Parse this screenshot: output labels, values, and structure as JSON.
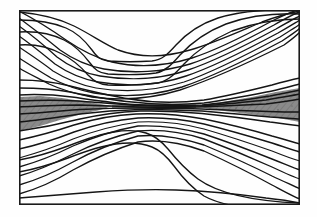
{
  "figure": {
    "title": "",
    "subtitle": "",
    "background_color": "#fefefe",
    "frame": {
      "x": 19,
      "y": 10,
      "width": 281,
      "height": 195,
      "stroke_color": "#1a1a1a",
      "stroke_width": 1.6
    }
  },
  "style": {
    "contour_color": "#151515",
    "shade_color": "#8a8a8a",
    "shade_color_dark": "#7c7c7c",
    "paper_color": "#fefefe"
  },
  "chart_data": {
    "type": "line",
    "plot_kind": "contour",
    "title": "",
    "xlabel": "",
    "ylabel": "",
    "xlim": [
      0,
      1
    ],
    "ylim": [
      0,
      1
    ],
    "grid": false,
    "legend": null,
    "axis_ticks_visible": false,
    "tick_labels_x": [],
    "tick_labels_y": [],
    "contour_count": 26,
    "levels": [
      -13,
      -12,
      -11,
      -10,
      -9,
      -8,
      -7,
      -6,
      -5,
      -4,
      -3,
      -2,
      -1,
      0,
      1,
      2,
      3,
      4,
      5,
      6,
      7,
      8,
      9,
      10,
      11,
      12
    ],
    "shaded_levels": [
      -1,
      0,
      1
    ],
    "series": [
      {
        "name": "upper-family",
        "count": 12,
        "note": "Contours run from upper-left downward to the right, flattening toward the central pinch; several form a basin dipping to the upper-centre."
      },
      {
        "name": "central-band",
        "count": 6,
        "note": "Near-horizontal tightly packed contours forming the pinch / shear layer at mid-height."
      },
      {
        "name": "lower-family",
        "count": 8,
        "note": "Contours run from lower-left upward to the right; several arch over the lower-centre dome."
      }
    ],
    "annotations": []
  }
}
